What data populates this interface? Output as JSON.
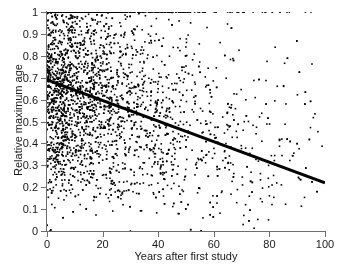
{
  "figure": {
    "background_color": "#ffffff",
    "axis_color": "#6e6e6e",
    "marker_color": "#000000",
    "fit_line_color": "#000000"
  },
  "chart_data": {
    "type": "scatter",
    "title": "",
    "xlabel": "Years after first study",
    "ylabel": "Relative maximum age",
    "xlim": [
      0,
      100
    ],
    "ylim": [
      0,
      1
    ],
    "xticks": [
      0,
      20,
      40,
      60,
      80,
      100
    ],
    "yticks": [
      0,
      0.1,
      0.2,
      0.3,
      0.4,
      0.5,
      0.6,
      0.7,
      0.8,
      0.9,
      1
    ],
    "xtick_labels": [
      "0",
      "20",
      "40",
      "60",
      "80",
      "100"
    ],
    "ytick_labels": [
      "0",
      "0.1",
      "0.2",
      "0.3",
      "0.4",
      "0.5",
      "0.6",
      "0.7",
      "0.8",
      "0.9",
      "1"
    ],
    "grid": false,
    "legend": null,
    "marker": {
      "shape": "square",
      "size_px": 1.6,
      "color": "#000000"
    },
    "series": [
      {
        "name": "observations",
        "type": "scatter",
        "n_points": 3400,
        "description": "Dense cloud of individual study observations; density highest near x=0 and decays with increasing years; strong ceiling accumulation at y=1.0.",
        "distribution": {
          "x_model": "exponential-like decay of density with x",
          "x_decay_scale": 26,
          "x_min": 0,
          "x_max": 100,
          "ceiling_fraction_at_y1": 0.085,
          "y_model": "linear trend plus heavy noise, clipped to [0,1]",
          "y_intercept": 0.69,
          "y_slope_per_year": -0.0047,
          "y_noise_sd": 0.265,
          "low_tail_thinning": true
        }
      }
    ],
    "fit_line": {
      "name": "linear regression fit",
      "type": "line",
      "x_start": 0,
      "y_start": 0.69,
      "x_end": 100,
      "y_end": 0.22,
      "slope": -0.0047,
      "intercept": 0.69,
      "width_px": 3,
      "color": "#000000"
    }
  }
}
